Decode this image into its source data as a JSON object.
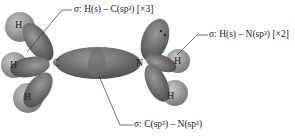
{
  "diagram": {
    "type": "molecular-orbital-bonding-diagram",
    "molecule": "methylamine",
    "atoms": {
      "carbon": "C",
      "nitrogen": "N",
      "hydrogen": "H"
    },
    "labels": {
      "ch_bond": "σ: H(s) – C(sp³) [×3]",
      "nh_bond": "σ: H(s) – N(sp³) [×2]",
      "cn_bond": "σ: C(sp³) – N(sp³)"
    },
    "colors": {
      "orbital_dark": "#6e6e6e",
      "orbital_light": "#a8a8a8",
      "hydrogen_sphere": "#9a9a9a",
      "leader_line": "#333333",
      "background": "#ffffff"
    }
  }
}
